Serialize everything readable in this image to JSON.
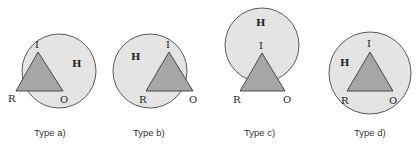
{
  "figure": {
    "panels": [
      {
        "id": "a",
        "caption": "Type a)",
        "labels": {
          "apex": "I",
          "left": "R",
          "right": "O",
          "circle": "H"
        },
        "description": "Circle H overlaps the right part of triangle; R lies outside circle"
      },
      {
        "id": "b",
        "caption": "Type b)",
        "labels": {
          "apex": "I",
          "left": "R",
          "right": "O",
          "circle": "H"
        },
        "description": "Circle H overlaps the left part of triangle; O lies outside circle"
      },
      {
        "id": "c",
        "caption": "Type c)",
        "labels": {
          "apex": "I",
          "left": "R",
          "right": "O",
          "circle": "H"
        },
        "description": "Circle H above triangle; only apex I inside circle"
      },
      {
        "id": "d",
        "caption": "Type d)",
        "labels": {
          "apex": "I",
          "left": "R",
          "right": "O",
          "circle": "H"
        },
        "description": "Triangle entirely inside circle H"
      }
    ],
    "colors": {
      "circle_fill": "#e4e4e4",
      "triangle_fill": "#a6a6a6",
      "outline": "#4a4a4a"
    }
  }
}
